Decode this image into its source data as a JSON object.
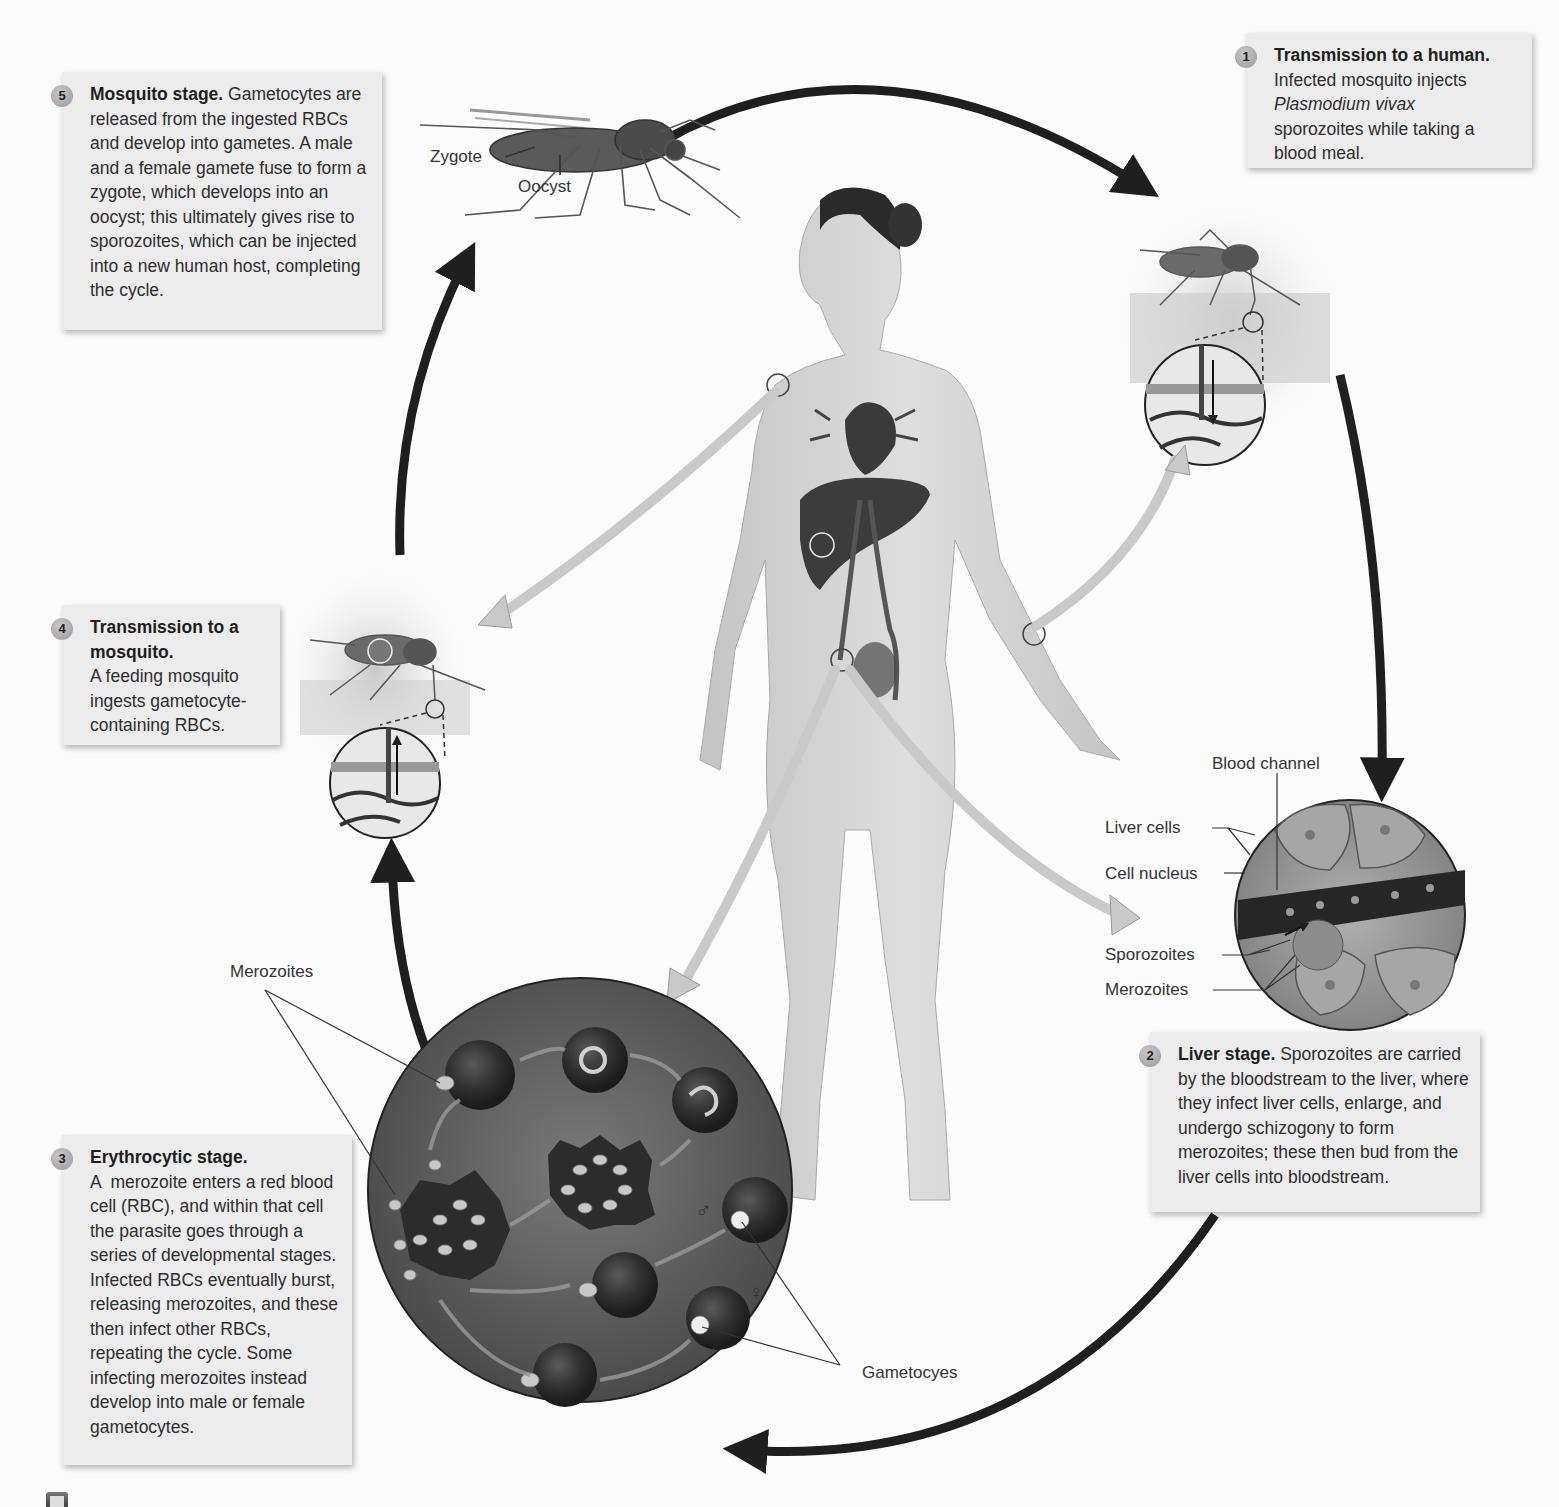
{
  "figure": {
    "topic": "Plasmodium vivax life cycle (malaria)",
    "stages": [
      {
        "number": "1",
        "title": "Transmission to a human.",
        "body_parts": [
          {
            "text": "Infected mosquito injects ",
            "style": "normal"
          },
          {
            "text": "Plasmodium vivax",
            "style": "italic"
          },
          {
            "text": " sporozoites while taking a blood meal.",
            "style": "normal"
          }
        ],
        "line1": "Infected mosquito injects",
        "italic": "Plasmodium vivax",
        "line3": "sporozoites while taking a blood meal."
      },
      {
        "number": "2",
        "title": "Liver stage.",
        "body": "Sporozoites are carried by the bloodstream to the liver, where they infect liver cells, enlarge, and undergo schizogony to form merozoites; these then bud from the liver cells into bloodstream."
      },
      {
        "number": "3",
        "title": "Erythrocytic stage.",
        "body": "A  merozoite enters a red blood cell (RBC), and within that cell the parasite goes through a series of developmental stages. Infected RBCs eventually burst, releasing merozoites, and these then infect other RBCs, repeating the cycle. Some infecting merozoites instead develop into male or female gametocytes."
      },
      {
        "number": "4",
        "title": "Transmission to a mosquito.",
        "body": "A feeding mosquito ingests gametocyte-containing RBCs."
      },
      {
        "number": "5",
        "title": "Mosquito stage.",
        "body": "Gametocytes are released from the ingested RBCs and develop into gametes. A male and a female gamete fuse to form a zygote, which develops into an oocyst; this ultimately gives rise to sporozoites, which can be injected into a new human host, completing the cycle."
      }
    ],
    "labels": {
      "zygote": "Zygote",
      "oocyst": "Oocyst",
      "blood_channel": "Blood channel",
      "liver_cells": "Liver cells",
      "cell_nucleus": "Cell nucleus",
      "sporozoites": "Sporozoites",
      "merozoites_liver": "Merozoites",
      "merozoites_rbc": "Merozoites",
      "gametocytes": "Gametocyes",
      "male_symbol": "♂",
      "female_symbol": "♀"
    },
    "colors": {
      "box_bg": "#ececec",
      "cycle_arrow": "#1f1f1f",
      "flow_arrow": "#c9c9c9",
      "badge": "#a8a8a8"
    }
  }
}
